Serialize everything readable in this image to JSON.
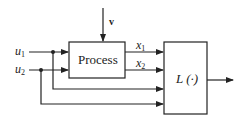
{
  "diagram": {
    "type": "block-diagram",
    "blocks": {
      "process": {
        "label": "Process"
      },
      "loss": {
        "label": "L (·)"
      }
    },
    "inputs": {
      "v": {
        "label": "v"
      },
      "u1": {
        "base": "u",
        "sub": "1"
      },
      "u2": {
        "base": "u",
        "sub": "2"
      }
    },
    "signals": {
      "x1": {
        "base": "x",
        "sub": "1"
      },
      "x2": {
        "base": "x",
        "sub": "2"
      }
    },
    "colors": {
      "line": "#222222",
      "background": "#ffffff"
    }
  }
}
